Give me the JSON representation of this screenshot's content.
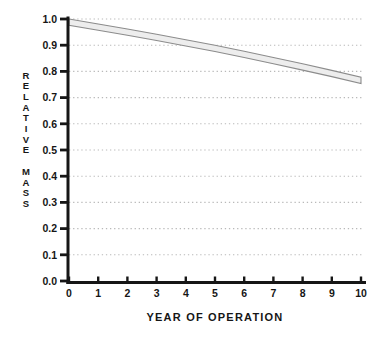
{
  "figure": {
    "background": "#ffffff"
  },
  "chart_data": {
    "type": "area",
    "title": "",
    "xlabel": "YEAR OF OPERATION",
    "ylabel": "RELATIVE MASS",
    "xlim": [
      0,
      10
    ],
    "ylim": [
      0.0,
      1.0
    ],
    "x_ticks": [
      "0",
      "1",
      "2",
      "3",
      "4",
      "5",
      "6",
      "7",
      "8",
      "9",
      "10"
    ],
    "y_ticks": [
      "0.0",
      "0.1",
      "0.2",
      "0.3",
      "0.4",
      "0.5",
      "0.6",
      "0.7",
      "0.8",
      "0.9",
      "1.0"
    ],
    "grid": {
      "horizontal": true,
      "style": "dotted",
      "color": "#b9b9b9"
    },
    "legend": "none",
    "band": {
      "name": "relative-mass-uncertainty-band",
      "x": [
        0,
        1,
        2,
        3,
        4,
        5,
        6,
        7,
        8,
        9,
        10
      ],
      "upper": [
        1.0,
        0.981,
        0.962,
        0.942,
        0.921,
        0.9,
        0.877,
        0.853,
        0.829,
        0.804,
        0.778
      ],
      "lower": [
        0.976,
        0.957,
        0.938,
        0.918,
        0.897,
        0.876,
        0.853,
        0.829,
        0.805,
        0.78,
        0.754
      ],
      "fill": "#ededed",
      "stroke": "#8c8c8c"
    },
    "axis_color": "#161616",
    "text_color": "#161616"
  }
}
